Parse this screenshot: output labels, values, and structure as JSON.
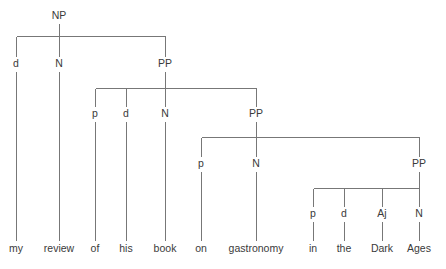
{
  "diagram": {
    "type": "constituency-syntax-tree",
    "sentence": "my review of his book on gastronomy in the Dark Ages",
    "background_color": "#ffffff",
    "line_color": "#777777",
    "text_color": "#3a3a3a",
    "nodes": [
      {
        "id": "np-root",
        "label": "NP",
        "x": 59,
        "y": 15
      },
      {
        "id": "d-my",
        "label": "d",
        "x": 16,
        "y": 63
      },
      {
        "id": "n-review",
        "label": "N",
        "x": 59,
        "y": 63
      },
      {
        "id": "pp-1",
        "label": "PP",
        "x": 165,
        "y": 63
      },
      {
        "id": "p-of",
        "label": "p",
        "x": 95,
        "y": 113
      },
      {
        "id": "d-his",
        "label": "d",
        "x": 126,
        "y": 113
      },
      {
        "id": "n-book",
        "label": "N",
        "x": 165,
        "y": 113
      },
      {
        "id": "pp-2",
        "label": "PP",
        "x": 256,
        "y": 113
      },
      {
        "id": "p-on",
        "label": "p",
        "x": 201,
        "y": 163
      },
      {
        "id": "n-gastro",
        "label": "N",
        "x": 256,
        "y": 163
      },
      {
        "id": "pp-3",
        "label": "PP",
        "x": 419,
        "y": 163
      },
      {
        "id": "p-in",
        "label": "p",
        "x": 313,
        "y": 213
      },
      {
        "id": "d-the",
        "label": "d",
        "x": 344,
        "y": 213
      },
      {
        "id": "aj-dark",
        "label": "Aj",
        "x": 382,
        "y": 213
      },
      {
        "id": "n-ages",
        "label": "N",
        "x": 419,
        "y": 213
      }
    ],
    "leaves": [
      {
        "id": "word-my",
        "label": "my",
        "x": 16,
        "y": 248
      },
      {
        "id": "word-review",
        "label": "review",
        "x": 59,
        "y": 248
      },
      {
        "id": "word-of",
        "label": "of",
        "x": 95,
        "y": 248
      },
      {
        "id": "word-his",
        "label": "his",
        "x": 126,
        "y": 248
      },
      {
        "id": "word-book",
        "label": "book",
        "x": 165,
        "y": 248
      },
      {
        "id": "word-on",
        "label": "on",
        "x": 201,
        "y": 248
      },
      {
        "id": "word-gastronomy",
        "label": "gastronomy",
        "x": 256,
        "y": 248
      },
      {
        "id": "word-in",
        "label": "in",
        "x": 313,
        "y": 248
      },
      {
        "id": "word-the",
        "label": "the",
        "x": 344,
        "y": 248
      },
      {
        "id": "word-dark",
        "label": "Dark",
        "x": 382,
        "y": 248
      },
      {
        "id": "word-ages",
        "label": "Ages",
        "x": 419,
        "y": 248
      }
    ],
    "branches": [
      {
        "id": "branch-np",
        "parent_x": 59,
        "bar_y": 36,
        "stem_top": 23,
        "children_x": [
          16,
          59,
          165
        ],
        "children_top": 56
      },
      {
        "id": "branch-pp1",
        "parent_x": 165,
        "bar_y": 88,
        "stem_top": 71,
        "children_x": [
          95,
          126,
          165,
          256
        ],
        "children_top": 106
      },
      {
        "id": "branch-pp2",
        "parent_x": 256,
        "bar_y": 137,
        "stem_top": 121,
        "children_x": [
          201,
          256,
          419
        ],
        "children_top": 156
      },
      {
        "id": "branch-pp3",
        "parent_x": 419,
        "bar_y": 188,
        "stem_top": 171,
        "children_x": [
          313,
          344,
          382,
          419
        ],
        "children_top": 206
      }
    ],
    "leaf_stems": [
      {
        "id": "stem-my",
        "x": 16,
        "top": 71,
        "bottom": 240
      },
      {
        "id": "stem-review",
        "x": 59,
        "top": 71,
        "bottom": 240
      },
      {
        "id": "stem-of",
        "x": 95,
        "top": 121,
        "bottom": 240
      },
      {
        "id": "stem-his",
        "x": 126,
        "top": 121,
        "bottom": 240
      },
      {
        "id": "stem-book",
        "x": 165,
        "top": 121,
        "bottom": 240
      },
      {
        "id": "stem-on",
        "x": 201,
        "top": 171,
        "bottom": 240
      },
      {
        "id": "stem-gastronomy",
        "x": 256,
        "top": 171,
        "bottom": 240
      },
      {
        "id": "stem-in",
        "x": 313,
        "top": 221,
        "bottom": 240
      },
      {
        "id": "stem-the",
        "x": 344,
        "top": 221,
        "bottom": 240
      },
      {
        "id": "stem-dark",
        "x": 382,
        "top": 221,
        "bottom": 240
      },
      {
        "id": "stem-ages",
        "x": 419,
        "top": 221,
        "bottom": 240
      }
    ]
  }
}
